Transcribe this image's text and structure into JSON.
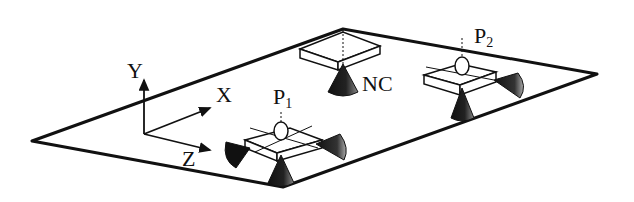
{
  "diagram": {
    "type": "isometric-schematic",
    "plane_vertices": {
      "left": [
        32,
        141
      ],
      "bottom": [
        283,
        187
      ],
      "right": [
        597,
        74
      ],
      "top": [
        343,
        29
      ]
    },
    "axes": {
      "x_label": "X",
      "y_label": "Y",
      "z_label": "Z"
    },
    "nodes": [
      {
        "id": "P1",
        "label": "P",
        "subscript": "1",
        "description": "platform with camera/sensor and three cone-shaped thrusters"
      },
      {
        "id": "P2",
        "label": "P",
        "subscript": "2",
        "description": "platform with camera/sensor and cone-shaped thrusters"
      },
      {
        "id": "NC",
        "label": "NC",
        "description": "box with downward cone, hanging from top vertex"
      }
    ],
    "colors": {
      "ink": "#111111",
      "background": "#ffffff",
      "cone_gray": "#666666"
    }
  }
}
